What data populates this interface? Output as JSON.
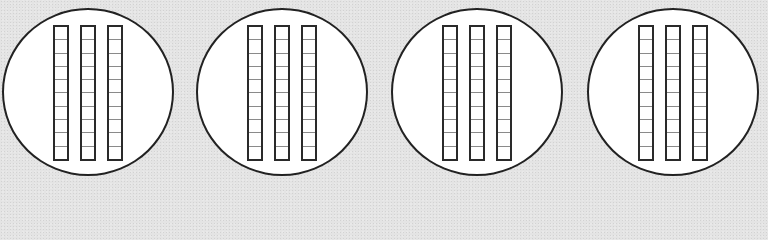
{
  "diagram": {
    "type": "base-ten-blocks-groups",
    "group_count": 4,
    "groups": [
      {
        "label": "group 1",
        "rods": 3,
        "cells_per_rod": 10,
        "left": 2
      },
      {
        "label": "group 2",
        "rods": 3,
        "cells_per_rod": 10,
        "left": 196
      },
      {
        "label": "group 3",
        "rods": 3,
        "cells_per_rod": 10,
        "left": 391
      },
      {
        "label": "group 4",
        "rods": 3,
        "cells_per_rod": 10,
        "left": 587
      }
    ],
    "colors": {
      "background": "#e4e4e4",
      "circle_fill": "#ffffff",
      "outline": "#222222",
      "cell_divider": "#8a8a8a"
    }
  }
}
